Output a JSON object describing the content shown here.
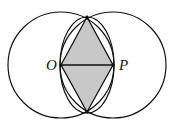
{
  "diagram": {
    "labels": {
      "O": "O",
      "P": "P"
    },
    "points": {
      "O": [
        61,
        65
      ],
      "P": [
        113,
        65
      ],
      "top": [
        87,
        17
      ],
      "bottom": [
        87,
        112
      ]
    },
    "circles": [
      {
        "name": "circle-O",
        "cx": 61,
        "cy": 65,
        "r": 53
      },
      {
        "name": "circle-P",
        "cx": 113,
        "cy": 65,
        "r": 53
      }
    ],
    "inner_ellipse": {
      "cx": 87,
      "cy": 65,
      "rx": 27,
      "ry": 48
    },
    "colors": {
      "stroke": "#111111",
      "fill": "#c8c8c8",
      "background": "#ffffff"
    }
  }
}
